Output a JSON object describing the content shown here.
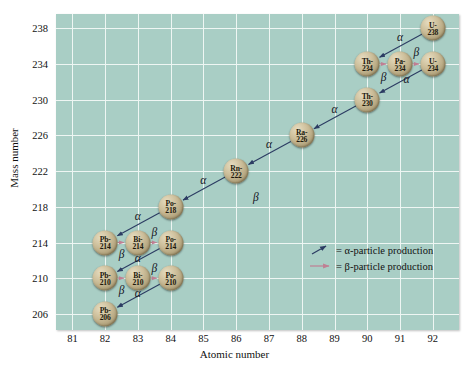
{
  "chart_data": {
    "type": "scatter",
    "xlabel": "Atomic number",
    "ylabel": "Mass number",
    "xlim": [
      80.5,
      92.8
    ],
    "ylim": [
      204.2,
      239.6
    ],
    "xticks": [
      81,
      82,
      83,
      84,
      85,
      86,
      87,
      88,
      89,
      90,
      91,
      92
    ],
    "yticks": [
      206,
      210,
      214,
      218,
      222,
      226,
      230,
      234,
      238
    ],
    "grid": true,
    "legend_position": "inside-center-right",
    "nuclides": [
      {
        "label_top": "U-",
        "label_bottom": "238",
        "name": "U-238",
        "z": 92,
        "a": 238
      },
      {
        "label_top": "Th-",
        "label_bottom": "234",
        "name": "Th-234",
        "z": 90,
        "a": 234
      },
      {
        "label_top": "Pa-",
        "label_bottom": "234",
        "name": "Pa-234",
        "z": 91,
        "a": 234
      },
      {
        "label_top": "U-",
        "label_bottom": "234",
        "name": "U-234",
        "z": 92,
        "a": 234
      },
      {
        "label_top": "Th-",
        "label_bottom": "230",
        "name": "Th-230",
        "z": 90,
        "a": 230
      },
      {
        "label_top": "Ra-",
        "label_bottom": "226",
        "name": "Ra-226",
        "z": 88,
        "a": 226
      },
      {
        "label_top": "Rn-",
        "label_bottom": "222",
        "name": "Rn-222",
        "z": 86,
        "a": 222
      },
      {
        "label_top": "Po-",
        "label_bottom": "218",
        "name": "Po-218",
        "z": 84,
        "a": 218
      },
      {
        "label_top": "Pb-",
        "label_bottom": "214",
        "name": "Pb-214",
        "z": 82,
        "a": 214
      },
      {
        "label_top": "Bi-",
        "label_bottom": "214",
        "name": "Bi-214",
        "z": 83,
        "a": 214
      },
      {
        "label_top": "Po-",
        "label_bottom": "214",
        "name": "Po-214",
        "z": 84,
        "a": 214
      },
      {
        "label_top": "Pb-",
        "label_bottom": "210",
        "name": "Pb-210",
        "z": 82,
        "a": 210
      },
      {
        "label_top": "Bi-",
        "label_bottom": "210",
        "name": "Bi-210",
        "z": 83,
        "a": 210
      },
      {
        "label_top": "Po-",
        "label_bottom": "210",
        "name": "Po-210",
        "z": 84,
        "a": 210
      },
      {
        "label_top": "Pb-",
        "label_bottom": "206",
        "name": "Pb-206",
        "z": 82,
        "a": 206
      }
    ],
    "decays": [
      {
        "from": "U-238",
        "to": "Th-234",
        "type": "alpha",
        "label": "α",
        "label_z": 91.0,
        "label_a": 237.0
      },
      {
        "from": "Th-234",
        "to": "Pa-234",
        "type": "beta",
        "label": "β",
        "label_z": 90.5,
        "label_a": 232.6
      },
      {
        "from": "Pa-234",
        "to": "U-234",
        "type": "beta",
        "label": "β",
        "label_z": 91.5,
        "label_a": 235.3
      },
      {
        "from": "U-234",
        "to": "Th-230",
        "type": "alpha",
        "label": "α",
        "label_z": 91.2,
        "label_a": 232.3
      },
      {
        "from": "Th-230",
        "to": "Ra-226",
        "type": "alpha",
        "label": "α",
        "label_z": 89.0,
        "label_a": 229.0
      },
      {
        "from": "Ra-226",
        "to": "Rn-222",
        "type": "alpha",
        "label": "α",
        "label_z": 87.0,
        "label_a": 225.0
      },
      {
        "from": "Rn-222",
        "to": "Po-218",
        "type": "alpha",
        "label": "α",
        "label_z": 85.0,
        "label_a": 221.0
      },
      {
        "from": "Po-218",
        "to": "Pb-214",
        "type": "alpha",
        "label": "α",
        "label_z": 83.0,
        "label_a": 217.0
      },
      {
        "from": "Pb-214",
        "to": "Bi-214",
        "type": "beta",
        "label": "β",
        "label_z": 82.5,
        "label_a": 212.7
      },
      {
        "from": "Bi-214",
        "to": "Po-214",
        "type": "beta",
        "label": "β",
        "label_z": 83.5,
        "label_a": 215.2
      },
      {
        "from": "Po-214",
        "to": "Pb-210",
        "type": "alpha",
        "label": "α",
        "label_z": 83.0,
        "label_a": 212.3
      },
      {
        "from": "Pb-210",
        "to": "Bi-210",
        "type": "beta",
        "label": "β",
        "label_z": 82.5,
        "label_a": 208.7
      },
      {
        "from": "Bi-210",
        "to": "Po-210",
        "type": "beta",
        "label": "β",
        "label_z": 83.5,
        "label_a": 211.2
      },
      {
        "from": "Po-210",
        "to": "Pb-206",
        "type": "alpha",
        "label": "α",
        "label_z": 83.0,
        "label_a": 208.3
      }
    ],
    "floating_labels": [
      {
        "label": "β",
        "z": 86.6,
        "a": 219.1
      }
    ],
    "legend": [
      {
        "icon": "alpha-arrow-icon",
        "text": "= α-particle production"
      },
      {
        "icon": "beta-arrow-icon",
        "text": "= β-particle production"
      }
    ],
    "colors": {
      "plot_background": "#a9cec5",
      "gridline": "#eef6f3",
      "alpha_arrow": "#2c3c63",
      "beta_arrow": "#c07f93",
      "nuclide_fill": "#c6b894",
      "text": "#111111"
    }
  }
}
